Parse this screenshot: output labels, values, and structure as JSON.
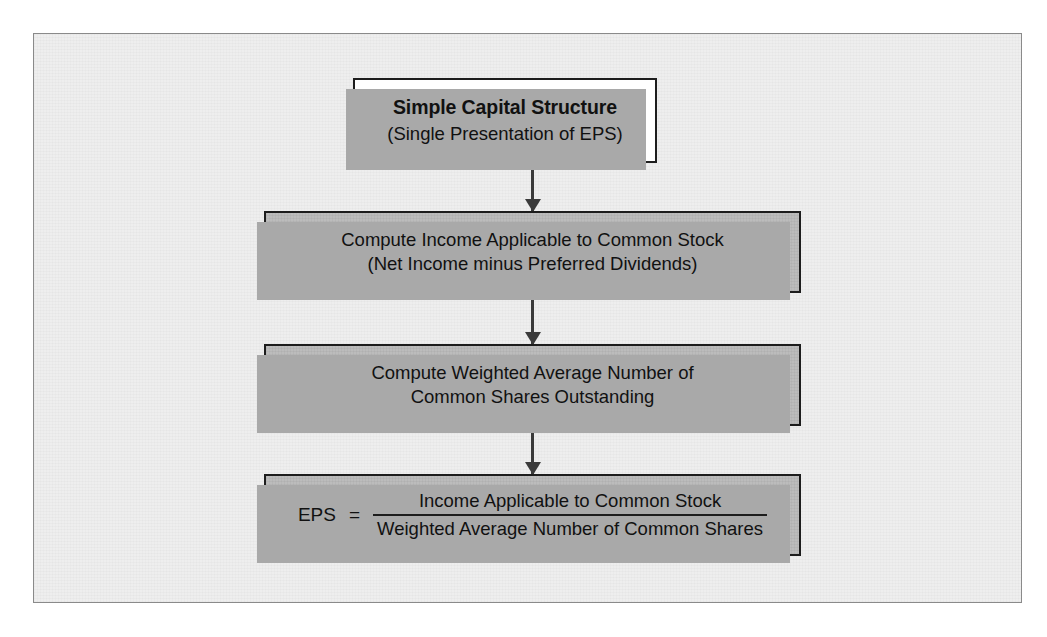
{
  "figure": {
    "name": "simple-capital-structure-eps-flowchart",
    "background_color": "#eeeeee",
    "frame_border_color": "#8a8a8a",
    "box_fill_gray": "#bcbcbc",
    "box_fill_white": "#ffffff",
    "box_border_color": "#1d1d1d",
    "shadow_color": "#a9a9a9",
    "arrow_color": "#3a3a3a"
  },
  "nodes": {
    "title": {
      "line1": "Simple Capital Structure",
      "line2": "(Single Presentation of EPS)"
    },
    "income": {
      "line1": "Compute Income Applicable to Common Stock",
      "line2": "(Net Income minus Preferred Dividends)"
    },
    "shares": {
      "line1": "Compute Weighted Average Number of",
      "line2": "Common Shares Outstanding"
    },
    "formula": {
      "lhs": "EPS",
      "equals": "=",
      "numerator": "Income Applicable to Common Stock",
      "denominator": "Weighted Average Number of Common Shares"
    }
  },
  "connectors": [
    {
      "name": "title-to-income",
      "from": "title",
      "to": "income",
      "direction": "down"
    },
    {
      "name": "income-to-shares",
      "from": "income",
      "to": "shares",
      "direction": "down"
    },
    {
      "name": "shares-to-formula",
      "from": "shares",
      "to": "formula",
      "direction": "down"
    }
  ]
}
